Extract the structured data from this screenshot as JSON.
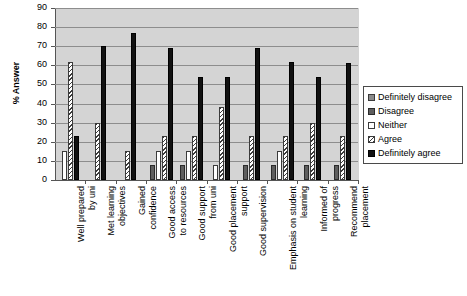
{
  "chart_data": {
    "type": "bar",
    "title": "",
    "xlabel": "",
    "ylabel": "% Answer",
    "ylim": [
      0,
      90
    ],
    "yticks": [
      0,
      10,
      20,
      30,
      40,
      50,
      60,
      70,
      80,
      90
    ],
    "grid": true,
    "legend_position": "right",
    "categories": [
      "Well prepared\nby uni",
      "Met learning\nobjectives",
      "Gained\nconfidence",
      "Good access\nto resources",
      "Good support\nfrom uni",
      "Good placement\nsupport",
      "Good supervision",
      "Emphasis on student\nlearning",
      "Informed of\nprogress",
      "Recommend\nplacement"
    ],
    "series": [
      {
        "name": "Definitely disagree",
        "values": [
          0,
          0,
          0,
          0,
          0,
          0,
          0,
          0,
          0,
          0
        ]
      },
      {
        "name": "Disagree",
        "values": [
          0,
          0,
          0,
          8,
          8,
          0,
          8,
          8,
          8,
          8
        ]
      },
      {
        "name": "Neither",
        "values": [
          15,
          0,
          0,
          15,
          15,
          8,
          0,
          15,
          0,
          0
        ]
      },
      {
        "name": "Agree",
        "values": [
          62,
          30,
          15,
          23,
          23,
          38,
          23,
          23,
          30,
          23
        ]
      },
      {
        "name": "Definitely agree",
        "values": [
          23,
          70,
          77,
          69,
          54,
          54,
          69,
          62,
          54,
          61
        ]
      }
    ]
  },
  "legend": {
    "entries": [
      {
        "label": "Definitely disagree"
      },
      {
        "label": "Disagree"
      },
      {
        "label": "Neither"
      },
      {
        "label": "Agree"
      },
      {
        "label": "Definitely agree"
      }
    ]
  },
  "colors": {
    "definitely_disagree": "#8a8a8a",
    "disagree": "#5e5e5e",
    "neither": "#ffffff",
    "agree": "#ffffff",
    "definitely_agree": "#111111",
    "plot_background": "#d4d4d4",
    "gridline": "#8d8d8d",
    "axis": "#555555"
  }
}
